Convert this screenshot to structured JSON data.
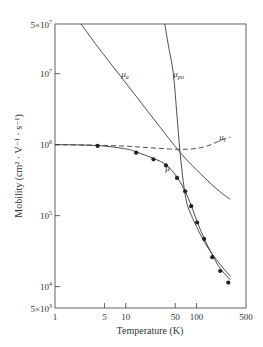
{
  "chart_data": {
    "type": "line",
    "title": "",
    "xlabel": "Temperature (K)",
    "ylabel": "Mobility (cm² · V⁻¹ · s⁻¹)",
    "xscale": "log",
    "yscale": "log",
    "xlim": [
      1,
      500
    ],
    "ylim": [
      5000,
      50000000
    ],
    "x_ticks": [
      {
        "value": 1,
        "label": "1"
      },
      {
        "value": 5,
        "label": "5"
      },
      {
        "value": 10,
        "label": "10"
      },
      {
        "value": 50,
        "label": "50"
      },
      {
        "value": 100,
        "label": "100"
      },
      {
        "value": 500,
        "label": "500"
      }
    ],
    "y_ticks": [
      {
        "value": 5000,
        "label": "5×10³",
        "base": "5×10",
        "exp": "3"
      },
      {
        "value": 10000,
        "label": "10⁴",
        "base": "10",
        "exp": "4"
      },
      {
        "value": 100000,
        "label": "10⁵",
        "base": "10",
        "exp": "5"
      },
      {
        "value": 1000000,
        "label": "10⁶",
        "base": "10",
        "exp": "6"
      },
      {
        "value": 10000000,
        "label": "10⁷",
        "base": "10",
        "exp": "7"
      },
      {
        "value": 50000000,
        "label": "5×10⁷",
        "base": "5×10",
        "exp": "7"
      }
    ],
    "grid": false,
    "legend": "inline labels",
    "series": [
      {
        "name": "μa",
        "label_main": "μ",
        "label_sub": "a",
        "style": "solid",
        "label_at": [
          8.6,
          9000000
        ],
        "points": [
          [
            2.33,
            50000000
          ],
          [
            4,
            24000000
          ],
          [
            7.9,
            10000000
          ],
          [
            15,
            4400000
          ],
          [
            30,
            1800000
          ],
          [
            58.5,
            780000
          ],
          [
            100,
            440000
          ],
          [
            200,
            230000
          ],
          [
            300,
            170000
          ]
        ]
      },
      {
        "name": "μpo",
        "label_main": "μ",
        "label_sub": "po",
        "style": "solid",
        "label_at": [
          47,
          9000000
        ],
        "points": [
          [
            35.6,
            50000000
          ],
          [
            40,
            25000000
          ],
          [
            47,
            10000000
          ],
          [
            53,
            2500000
          ],
          [
            58.5,
            780000
          ],
          [
            65,
            300000
          ],
          [
            73,
            150000
          ],
          [
            85,
            100000
          ],
          [
            100,
            70000
          ],
          [
            130,
            42000
          ],
          [
            170,
            28000
          ],
          [
            230,
            19000
          ],
          [
            300,
            14000
          ]
        ]
      },
      {
        "name": "μi",
        "label_main": "μ",
        "label_sub": "i",
        "style": "dashed",
        "label_at": [
          210,
          1150000
        ],
        "points": [
          [
            1,
            1000000
          ],
          [
            4,
            980000
          ],
          [
            10,
            950000
          ],
          [
            20,
            910000
          ],
          [
            40,
            870000
          ],
          [
            58.5,
            860000
          ],
          [
            80,
            865000
          ],
          [
            112,
            900000
          ],
          [
            160,
            1000000
          ],
          [
            220,
            1150000
          ],
          [
            300,
            1270000
          ]
        ]
      },
      {
        "name": "μ",
        "label_main": "μ",
        "label_sub": "",
        "style": "solid",
        "label_at": [
          36,
          420000
        ],
        "points": [
          [
            1,
            1000000
          ],
          [
            4,
            970000
          ],
          [
            10,
            870000
          ],
          [
            14,
            790000
          ],
          [
            24.6,
            640000
          ],
          [
            37,
            520000
          ],
          [
            53,
            350000
          ],
          [
            69,
            220000
          ],
          [
            84,
            140000
          ],
          [
            102,
            82000
          ],
          [
            128,
            48000
          ],
          [
            167,
            28000
          ],
          [
            216,
            18000
          ],
          [
            300,
            12500
          ]
        ]
      }
    ],
    "markers": {
      "series": "μ (measured)",
      "points": [
        [
          4.0,
          960000
        ],
        [
          14,
          770000
        ],
        [
          24.6,
          620000
        ],
        [
          37,
          510000
        ],
        [
          53,
          340000
        ],
        [
          69,
          220000
        ],
        [
          84,
          136000
        ],
        [
          102,
          80000
        ],
        [
          128,
          47000
        ],
        [
          167,
          26000
        ],
        [
          216,
          16600
        ],
        [
          281,
          11400
        ]
      ]
    }
  }
}
